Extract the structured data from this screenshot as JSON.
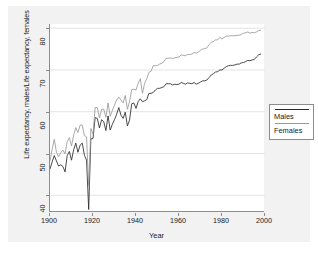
{
  "chart_data": {
    "type": "line",
    "title": "",
    "xlabel": "Year",
    "ylabel": "Life expectancy, males/Life expectancy, females",
    "xlim": [
      1900,
      2000
    ],
    "ylim": [
      36,
      81
    ],
    "xticks": [
      "1900",
      "1920",
      "1940",
      "1960",
      "1980",
      "2000"
    ],
    "xtick_values": [
      1900,
      1920,
      1940,
      1960,
      1980,
      2000
    ],
    "yticks": [
      "40",
      "50",
      "60",
      "70",
      "80"
    ],
    "ytick_values": [
      40,
      50,
      60,
      70,
      80
    ],
    "grid": "horizontal",
    "legend_position": "right-outside",
    "colors": {
      "males_line": "#2b2b2b",
      "females_line": "#9a9a9a",
      "axis": "#8c8c8c",
      "gridline": "#e3e3e3",
      "canvas_background": "#f2f2f2",
      "plot_background": "#ffffff",
      "text": "#1a1a1a"
    },
    "x": [
      1900,
      1901,
      1902,
      1903,
      1904,
      1905,
      1906,
      1907,
      1908,
      1909,
      1910,
      1911,
      1912,
      1913,
      1914,
      1915,
      1916,
      1917,
      1918,
      1919,
      1920,
      1921,
      1922,
      1923,
      1924,
      1925,
      1926,
      1927,
      1928,
      1929,
      1930,
      1931,
      1932,
      1933,
      1934,
      1935,
      1936,
      1937,
      1938,
      1939,
      1940,
      1941,
      1942,
      1943,
      1944,
      1945,
      1946,
      1947,
      1948,
      1949,
      1950,
      1951,
      1952,
      1953,
      1954,
      1955,
      1956,
      1957,
      1958,
      1959,
      1960,
      1961,
      1962,
      1963,
      1964,
      1965,
      1966,
      1967,
      1968,
      1969,
      1970,
      1971,
      1972,
      1973,
      1974,
      1975,
      1976,
      1977,
      1978,
      1979,
      1980,
      1981,
      1982,
      1983,
      1984,
      1985,
      1986,
      1987,
      1988,
      1989,
      1990,
      1991,
      1992,
      1993,
      1994,
      1995,
      1996,
      1997,
      1998
    ],
    "series": [
      {
        "name": "Males",
        "color": "#2b2b2b",
        "values": [
          46.3,
          48.0,
          49.5,
          48.2,
          47.0,
          47.3,
          46.9,
          45.6,
          49.5,
          50.5,
          48.4,
          50.9,
          52.5,
          50.3,
          52.0,
          52.5,
          49.6,
          48.4,
          36.6,
          53.5,
          53.6,
          58.6,
          58.4,
          56.1,
          58.1,
          57.6,
          55.5,
          59.0,
          55.6,
          57.0,
          58.1,
          59.4,
          61.0,
          59.2,
          58.4,
          59.9,
          56.6,
          58.0,
          61.9,
          62.1,
          60.8,
          62.4,
          63.1,
          62.4,
          62.6,
          62.9,
          64.4,
          64.4,
          64.6,
          65.2,
          65.6,
          65.6,
          65.8,
          66.0,
          66.7,
          66.7,
          66.7,
          66.4,
          66.6,
          66.5,
          66.6,
          67.0,
          66.8,
          66.6,
          66.9,
          66.8,
          66.7,
          67.0,
          66.6,
          66.8,
          67.1,
          67.4,
          67.4,
          67.6,
          68.2,
          68.8,
          69.1,
          69.5,
          69.6,
          70.0,
          70.0,
          70.4,
          70.8,
          71.0,
          71.1,
          71.1,
          71.2,
          71.4,
          71.4,
          71.7,
          71.8,
          72.0,
          72.3,
          72.2,
          72.4,
          72.5,
          73.1,
          73.6,
          73.8
        ]
      },
      {
        "name": "Females",
        "color": "#9a9a9a",
        "values": [
          48.3,
          51.0,
          53.4,
          50.3,
          49.2,
          50.2,
          50.8,
          49.9,
          52.8,
          53.8,
          51.8,
          54.4,
          56.2,
          55.0,
          56.8,
          56.8,
          54.3,
          54.0,
          42.2,
          56.0,
          54.6,
          61.0,
          61.0,
          58.5,
          60.6,
          60.6,
          58.7,
          62.1,
          58.9,
          60.3,
          61.6,
          62.8,
          63.5,
          62.8,
          62.1,
          63.9,
          60.6,
          62.4,
          65.3,
          65.4,
          65.2,
          66.8,
          67.9,
          64.4,
          66.8,
          67.9,
          69.4,
          69.7,
          71.0,
          71.0,
          71.1,
          71.4,
          71.6,
          72.0,
          72.8,
          72.8,
          72.9,
          72.7,
          72.9,
          73.0,
          73.1,
          73.6,
          73.5,
          73.4,
          73.7,
          73.7,
          73.8,
          74.2,
          74.0,
          74.3,
          74.7,
          75.0,
          75.1,
          75.3,
          76.1,
          76.6,
          76.8,
          77.2,
          77.2,
          77.8,
          77.4,
          77.8,
          78.1,
          78.1,
          78.2,
          78.2,
          78.2,
          78.3,
          78.3,
          78.5,
          78.8,
          78.9,
          79.1,
          78.8,
          79.0,
          78.9,
          79.1,
          79.4,
          79.5
        ]
      }
    ]
  },
  "legend": {
    "entries": [
      {
        "label": "Males",
        "color": "#2b2b2b"
      },
      {
        "label": "Females",
        "color": "#9a9a9a"
      }
    ]
  },
  "axes": {
    "x_title": "Year",
    "y_title": "Life expectancy, males/Life expectancy, females",
    "x_tick_labels": [
      "1900",
      "1920",
      "1940",
      "1960",
      "1980",
      "2000"
    ],
    "y_tick_labels": [
      "40",
      "50",
      "60",
      "70",
      "80"
    ]
  }
}
